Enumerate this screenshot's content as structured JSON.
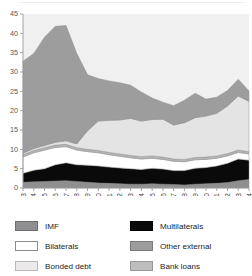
{
  "chart_data": {
    "type": "area",
    "title": "",
    "xlabel": "",
    "ylabel": "",
    "stacked": true,
    "grid": false,
    "legend_position": "bottom",
    "ylim": [
      0,
      45
    ],
    "yticks": [
      0,
      5,
      10,
      15,
      20,
      25,
      30,
      35,
      40,
      45
    ],
    "categories": [
      "1983",
      "1984",
      "1985",
      "1986",
      "1987",
      "1988",
      "1989",
      "1990",
      "1991",
      "1992",
      "1993",
      "1994",
      "1995",
      "1996",
      "1997",
      "1998",
      "1999",
      "2000",
      "2001",
      "2002",
      "2003",
      "2004"
    ],
    "series": [
      {
        "name": "IMF",
        "color": "#8f8f91",
        "values": [
          1.5,
          1.6,
          1.7,
          1.8,
          1.9,
          1.7,
          1.5,
          1.3,
          1.2,
          1.1,
          1.0,
          1.0,
          1.1,
          1.0,
          0.9,
          0.8,
          1.0,
          1.1,
          1.2,
          1.4,
          1.9,
          2.2
        ]
      },
      {
        "name": "Multilaterals",
        "color": "#0a0a0a",
        "values": [
          2.3,
          3.0,
          3.3,
          4.2,
          4.6,
          4.3,
          4.4,
          4.4,
          4.2,
          4.1,
          4.0,
          3.8,
          4.0,
          3.9,
          3.6,
          3.7,
          4.1,
          4.2,
          4.5,
          5.0,
          5.6,
          5.0
        ]
      },
      {
        "name": "Bilaterals",
        "color": "#ffffff",
        "values": [
          4.2,
          4.5,
          4.8,
          4.5,
          4.2,
          3.8,
          3.5,
          3.4,
          3.2,
          3.0,
          2.8,
          2.7,
          2.6,
          2.5,
          2.4,
          2.3,
          2.2,
          2.1,
          2.0,
          1.9,
          1.7,
          1.6
        ]
      },
      {
        "name": "Bank loans",
        "color": "#b5b5b5",
        "values": [
          0.6,
          0.6,
          0.6,
          0.6,
          0.6,
          0.6,
          0.6,
          0.6,
          0.6,
          0.6,
          0.6,
          0.6,
          0.6,
          0.6,
          0.6,
          0.6,
          0.6,
          0.6,
          0.6,
          0.6,
          0.6,
          0.6
        ]
      },
      {
        "name": "Bonded debt",
        "color": "#e4e4e4",
        "values": [
          0.4,
          0.5,
          0.6,
          0.7,
          0.9,
          1.0,
          4.8,
          7.6,
          8.3,
          8.8,
          9.6,
          9.2,
          9.4,
          9.8,
          8.8,
          9.5,
          10.3,
          10.6,
          11.0,
          12.3,
          14.0,
          13.0
        ]
      },
      {
        "name": "Other external",
        "color": "#9d9d9d",
        "values": [
          23.8,
          24.6,
          28.0,
          30.0,
          29.8,
          23.4,
          14.5,
          11.0,
          10.2,
          9.6,
          8.6,
          7.5,
          5.6,
          4.4,
          5.0,
          5.8,
          6.3,
          4.4,
          4.2,
          4.0,
          4.3,
          2.7
        ]
      }
    ]
  },
  "legend": {
    "items": [
      {
        "label": "IMF",
        "color": "#8f8f91",
        "border": "#6d6d6f"
      },
      {
        "label": "Multilaterals",
        "color": "#0a0a0a",
        "border": "#000000"
      },
      {
        "label": "Bilaterals",
        "color": "#ffffff",
        "border": "#8d8d8f"
      },
      {
        "label": "Other external",
        "color": "#9d9d9d",
        "border": "#7b7b7d"
      },
      {
        "label": "Bonded debt",
        "color": "#eceaea",
        "border": "#b9b9bb"
      },
      {
        "label": "Bank loans",
        "color": "#bdbdbd",
        "border": "#98989a"
      }
    ]
  }
}
